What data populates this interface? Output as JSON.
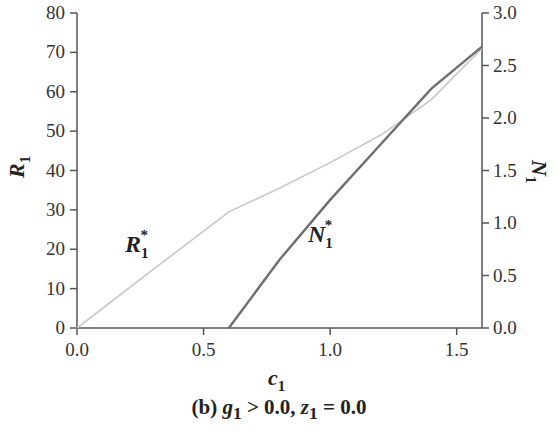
{
  "chart_data": {
    "type": "line",
    "title": "",
    "caption": "(b) g1 > 0.0, z1 = 0.0",
    "caption_parts": {
      "prefix": "(b) ",
      "g": "g",
      "g_sub": "1",
      "mid": " > 0.0, ",
      "z": "z",
      "z_sub": "1",
      "suffix": " = 0.0"
    },
    "xlabel": "c1",
    "ylabel_left": "R1",
    "ylabel_right": "N1",
    "xlim": [
      0.0,
      1.6
    ],
    "ylim_left": [
      0,
      80
    ],
    "ylim_right": [
      0.0,
      3.0
    ],
    "x_ticks": [
      "0.0",
      "0.5",
      "1.0",
      "1.5"
    ],
    "y_left_ticks": [
      "0",
      "10",
      "20",
      "30",
      "40",
      "50",
      "60",
      "70",
      "80"
    ],
    "y_right_ticks": [
      "0.0",
      "0.5",
      "1.0",
      "1.5",
      "2.0",
      "2.5",
      "3.0"
    ],
    "grid": false,
    "legend": "none (inline labels)",
    "series": [
      {
        "name": "R1*",
        "axis": "left",
        "color": "#c8c8c8",
        "x": [
          0.0,
          0.3,
          0.6,
          0.8,
          1.0,
          1.2,
          1.4,
          1.6
        ],
        "values": [
          0,
          14.8,
          29.5,
          35.5,
          42,
          49,
          58,
          71
        ]
      },
      {
        "name": "N1*",
        "axis": "right",
        "color": "#6e6e6e",
        "x": [
          0.6,
          0.8,
          1.0,
          1.2,
          1.4,
          1.6
        ],
        "values": [
          0.0,
          0.65,
          1.22,
          1.75,
          2.28,
          2.68
        ]
      }
    ],
    "annotations": [
      {
        "text": "R1*",
        "x": 0.28,
        "y_left": 22
      },
      {
        "text": "N1*",
        "x": 1.0,
        "y_left": 31
      }
    ]
  }
}
